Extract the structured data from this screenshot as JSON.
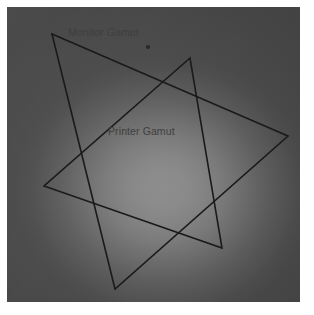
{
  "figure": {
    "background_color": "#ffffff",
    "plate": {
      "name": "gradient-plate",
      "x": 7,
      "y": 7,
      "width": 293,
      "height": 295,
      "center_color": "#ffffff",
      "edge_color": "#8a8a8a",
      "highlight_center": "54% 62%"
    },
    "stroke_color": "#1a1a1a",
    "stroke_width": 1.6
  },
  "labels": {
    "monitor": "Monitor Gamut",
    "printer": "Printer Gamut"
  },
  "shapes": {
    "monitor_gamut": {
      "name": "monitor-gamut-triangle",
      "points": "52,34 288,136 115,289",
      "vertices": [
        {
          "x": 52,
          "y": 34
        },
        {
          "x": 288,
          "y": 136
        },
        {
          "x": 115,
          "y": 289
        }
      ]
    },
    "printer_gamut": {
      "name": "printer-gamut-triangle",
      "points": "190,58 44,186 222,248",
      "vertices": [
        {
          "x": 190,
          "y": 58
        },
        {
          "x": 44,
          "y": 186
        },
        {
          "x": 222,
          "y": 248
        }
      ]
    }
  },
  "marker": {
    "name": "reference-point",
    "x": 148,
    "y": 47,
    "color": "#2a2a2a"
  },
  "chart_data": {
    "type": "scatter",
    "xlabel": "",
    "ylabel": "",
    "grid": false,
    "legend": "inline-annotations",
    "annotations": [
      {
        "text": "Monitor Gamut",
        "x": 68,
        "y": 27
      },
      {
        "text": "Printer Gamut",
        "x": 108,
        "y": 126
      }
    ],
    "series": [
      {
        "name": "Monitor Gamut",
        "shape": "triangle",
        "closed": true,
        "x": [
          52,
          288,
          115
        ],
        "y": [
          34,
          136,
          289
        ]
      },
      {
        "name": "Printer Gamut",
        "shape": "triangle",
        "closed": true,
        "x": [
          190,
          44,
          222
        ],
        "y": [
          58,
          186,
          248
        ]
      }
    ],
    "points": [
      {
        "name": "reference-point",
        "x": 148,
        "y": 47
      }
    ],
    "xlim": [
      7,
      300
    ],
    "ylim": [
      7,
      302
    ]
  }
}
